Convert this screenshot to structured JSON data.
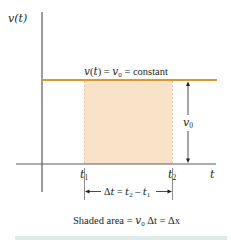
{
  "diagram": {
    "type": "velocity-time graph",
    "y_axis_label": "v(t)",
    "x_axis_label": "t",
    "line_label": "v(t) = v0 = constant",
    "line_label_parts": {
      "lhs": "v(t) = ",
      "v": "v",
      "sub": "0",
      "rhs": " = constant"
    },
    "height_label": {
      "v": "v",
      "sub": "0"
    },
    "t1_label": {
      "t": "t",
      "sub": "1"
    },
    "t2_label": {
      "t": "t",
      "sub": "2"
    },
    "delta_t_label": {
      "prefix": "Δt = ",
      "t2": "t",
      "t2sub": "2",
      "minus": " – ",
      "t1": "t",
      "t1sub": "1"
    },
    "caption": {
      "prefix": "Shaded area = ",
      "v": "v",
      "vsub": "0",
      "mid": " Δt = Δx"
    },
    "colors": {
      "axis": "#5a5a5a",
      "constant_line": "#d9963a",
      "shaded_area": "#f8e3c8",
      "shaded_border": "#e9c89a",
      "text": "#231f20",
      "bottom_bar": "#dbece8"
    }
  }
}
